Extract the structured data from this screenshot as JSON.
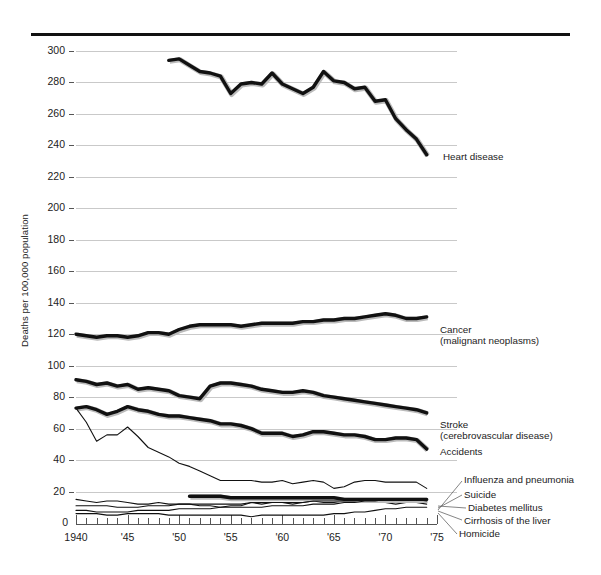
{
  "chart_data": {
    "type": "line",
    "title": "",
    "xlabel": "",
    "ylabel": "Deaths per 100,000 population",
    "xlim": [
      1940,
      1975
    ],
    "ylim": [
      0,
      310
    ],
    "grid": true,
    "legend_position": "right-inline-labels",
    "ytick_labels": [
      "0",
      "20",
      "40",
      "60",
      "80",
      "100",
      "120",
      "140",
      "160",
      "180",
      "200",
      "220",
      "240",
      "260",
      "280",
      "300"
    ],
    "ytick_values": [
      0,
      20,
      40,
      60,
      80,
      100,
      120,
      140,
      160,
      180,
      200,
      220,
      240,
      260,
      280,
      300
    ],
    "xtick_labels": [
      "1940",
      "'45",
      "'50",
      "'55",
      "'60",
      "'65",
      "'70",
      "'75"
    ],
    "xtick_values": [
      1940,
      1945,
      1950,
      1955,
      1960,
      1965,
      1970,
      1975
    ],
    "series": [
      {
        "name": "Heart disease",
        "label": "Heart disease",
        "weight": "heavy",
        "x": [
          1949,
          1950,
          1951,
          1952,
          1953,
          1954,
          1955,
          1956,
          1957,
          1958,
          1959,
          1960,
          1961,
          1962,
          1963,
          1964,
          1965,
          1966,
          1967,
          1968,
          1969,
          1970,
          1971,
          1972,
          1973,
          1974
        ],
        "values": [
          294,
          295,
          291,
          287,
          286,
          284,
          273,
          279,
          280,
          279,
          286,
          279,
          276,
          273,
          277,
          287,
          281,
          280,
          276,
          277,
          268,
          269,
          257,
          250,
          244,
          234
        ]
      },
      {
        "name": "Cancer (malignant neoplasms)",
        "label": "Cancer",
        "label2": "(malignant neoplasms)",
        "weight": "heavy",
        "x": [
          1940,
          1941,
          1942,
          1943,
          1944,
          1945,
          1946,
          1947,
          1948,
          1949,
          1950,
          1951,
          1952,
          1953,
          1954,
          1955,
          1956,
          1957,
          1958,
          1959,
          1960,
          1961,
          1962,
          1963,
          1964,
          1965,
          1966,
          1967,
          1968,
          1969,
          1970,
          1971,
          1972,
          1973,
          1974
        ],
        "values": [
          120,
          119,
          118,
          119,
          119,
          118,
          119,
          121,
          121,
          120,
          123,
          125,
          126,
          126,
          126,
          126,
          125,
          126,
          127,
          127,
          127,
          127,
          128,
          128,
          129,
          129,
          130,
          130,
          131,
          132,
          133,
          132,
          130,
          130,
          131
        ]
      },
      {
        "name": "Stroke (cerebrovascular disease)",
        "label": "Stroke",
        "label2": "(cerebrovascular disease)",
        "weight": "heavy",
        "x": [
          1940,
          1941,
          1942,
          1943,
          1944,
          1945,
          1946,
          1947,
          1948,
          1949,
          1950,
          1951,
          1952,
          1953,
          1954,
          1955,
          1956,
          1957,
          1958,
          1959,
          1960,
          1961,
          1962,
          1963,
          1964,
          1965,
          1966,
          1967,
          1968,
          1969,
          1970,
          1971,
          1972,
          1973,
          1974
        ],
        "values": [
          91,
          90,
          88,
          89,
          87,
          88,
          85,
          86,
          85,
          84,
          81,
          80,
          79,
          87,
          89,
          89,
          88,
          87,
          85,
          84,
          83,
          83,
          84,
          83,
          81,
          80,
          79,
          78,
          77,
          76,
          75,
          74,
          73,
          72,
          70
        ]
      },
      {
        "name": "Accidents",
        "label": "Accidents",
        "weight": "heavy",
        "x": [
          1940,
          1941,
          1942,
          1943,
          1944,
          1945,
          1946,
          1947,
          1948,
          1949,
          1950,
          1951,
          1952,
          1953,
          1954,
          1955,
          1956,
          1957,
          1958,
          1959,
          1960,
          1961,
          1962,
          1963,
          1964,
          1965,
          1966,
          1967,
          1968,
          1969,
          1970,
          1971,
          1972,
          1973,
          1974
        ],
        "values": [
          73,
          74,
          72,
          69,
          71,
          74,
          72,
          71,
          69,
          68,
          68,
          67,
          66,
          65,
          63,
          63,
          62,
          60,
          57,
          57,
          57,
          55,
          56,
          58,
          58,
          57,
          56,
          56,
          55,
          53,
          53,
          54,
          54,
          53,
          47
        ]
      },
      {
        "name": "Accidents (motor vehicle sub-line)",
        "label": "",
        "weight": "light",
        "x": [
          1940,
          1941,
          1942,
          1943,
          1944,
          1945,
          1946,
          1947,
          1948,
          1949,
          1950,
          1951,
          1952,
          1953,
          1954,
          1955,
          1956,
          1957,
          1958,
          1959,
          1960,
          1961,
          1962,
          1963,
          1964,
          1965,
          1966,
          1967,
          1968,
          1969,
          1970,
          1971,
          1972,
          1973,
          1974
        ],
        "values": [
          73,
          64,
          52,
          56,
          56,
          61,
          55,
          48,
          45,
          42,
          38,
          36,
          33,
          30,
          27,
          27,
          27,
          27,
          26,
          26,
          27,
          25,
          26,
          27,
          26,
          22,
          23,
          26,
          27,
          27,
          26,
          26,
          26,
          26,
          22
        ]
      },
      {
        "name": "Influenza and pneumonia",
        "label": "Influenza and pneumonia",
        "weight": "light",
        "x": [
          1940,
          1941,
          1942,
          1943,
          1944,
          1945,
          1946,
          1947,
          1948,
          1949,
          1950,
          1951,
          1952,
          1953,
          1954,
          1955,
          1956,
          1957,
          1958,
          1959,
          1960,
          1961,
          1962,
          1963,
          1964,
          1965,
          1966,
          1967,
          1968,
          1969,
          1970,
          1971,
          1972,
          1973,
          1974
        ],
        "values": [
          15,
          14,
          13,
          14,
          14,
          13,
          12,
          12,
          13,
          12,
          12,
          12,
          11,
          11,
          10,
          11,
          11,
          13,
          12,
          13,
          13,
          12,
          13,
          14,
          13,
          13,
          14,
          13,
          14,
          13,
          13,
          12,
          13,
          13,
          12
        ]
      },
      {
        "name": "Suicide",
        "label": "Suicide",
        "weight": "heavy",
        "x": [
          1951,
          1952,
          1953,
          1954,
          1955,
          1956,
          1957,
          1958,
          1959,
          1960,
          1961,
          1962,
          1963,
          1964,
          1965,
          1966,
          1967,
          1968,
          1969,
          1970,
          1971,
          1972,
          1973,
          1974
        ],
        "values": [
          17,
          17,
          17,
          17,
          16,
          16,
          16,
          16,
          16,
          16,
          16,
          16,
          16,
          16,
          16,
          15,
          15,
          15,
          15,
          15,
          15,
          15,
          15,
          15
        ]
      },
      {
        "name": "Diabetes mellitus",
        "label": "Diabetes mellitus",
        "weight": "light",
        "x": [
          1940,
          1941,
          1942,
          1943,
          1944,
          1945,
          1946,
          1947,
          1948,
          1949,
          1950,
          1951,
          1952,
          1953,
          1954,
          1955,
          1956,
          1957,
          1958,
          1959,
          1960,
          1961,
          1962,
          1963,
          1964,
          1965,
          1966,
          1967,
          1968,
          1969,
          1970,
          1971,
          1972,
          1973,
          1974
        ],
        "values": [
          11,
          11,
          11,
          11,
          10,
          10,
          10,
          11,
          11,
          11,
          12,
          12,
          12,
          12,
          12,
          12,
          12,
          13,
          13,
          13,
          13,
          13,
          13,
          14,
          14,
          14,
          14,
          14,
          15,
          15,
          15,
          15,
          15,
          15,
          14
        ]
      },
      {
        "name": "Cirrhosis of the liver",
        "label": "Cirrhosis of the liver",
        "weight": "light",
        "x": [
          1940,
          1941,
          1942,
          1943,
          1944,
          1945,
          1946,
          1947,
          1948,
          1949,
          1950,
          1951,
          1952,
          1953,
          1954,
          1955,
          1956,
          1957,
          1958,
          1959,
          1960,
          1961,
          1962,
          1963,
          1964,
          1965,
          1966,
          1967,
          1968,
          1969,
          1970,
          1971,
          1972,
          1973,
          1974
        ],
        "values": [
          8,
          8,
          7,
          7,
          7,
          7,
          8,
          8,
          8,
          8,
          9,
          9,
          9,
          9,
          10,
          10,
          10,
          10,
          10,
          11,
          11,
          11,
          11,
          12,
          12,
          12,
          13,
          13,
          14,
          14,
          15,
          15,
          15,
          15,
          15
        ]
      },
      {
        "name": "Homicide",
        "label": "Homicide",
        "weight": "light",
        "x": [
          1940,
          1941,
          1942,
          1943,
          1944,
          1945,
          1946,
          1947,
          1948,
          1949,
          1950,
          1951,
          1952,
          1953,
          1954,
          1955,
          1956,
          1957,
          1958,
          1959,
          1960,
          1961,
          1962,
          1963,
          1964,
          1965,
          1966,
          1967,
          1968,
          1969,
          1970,
          1971,
          1972,
          1973,
          1974
        ],
        "values": [
          6,
          6,
          6,
          5,
          5,
          6,
          6,
          6,
          6,
          5,
          5,
          5,
          5,
          5,
          5,
          5,
          5,
          4,
          5,
          5,
          5,
          5,
          5,
          5,
          5,
          6,
          6,
          7,
          7,
          8,
          9,
          9,
          10,
          10,
          10
        ]
      }
    ]
  },
  "axis": {
    "y_label": "Deaths per 100,000 population",
    "zero_label": "0"
  },
  "labels": {
    "heart_disease": "Heart disease",
    "cancer_1": "Cancer",
    "cancer_2": "(malignant neoplasms)",
    "stroke_1": "Stroke",
    "stroke_2": "(cerebrovascular disease)",
    "accidents": "Accidents",
    "influenza": "Influenza and pneumonia",
    "suicide": "Suicide",
    "diabetes": "Diabetes mellitus",
    "cirrhosis": "Cirrhosis of the liver",
    "homicide": "Homicide"
  },
  "colors": {
    "line": "#111111",
    "grid": "#c9c9c9",
    "axis": "#555555",
    "text": "#1a1a1a"
  }
}
